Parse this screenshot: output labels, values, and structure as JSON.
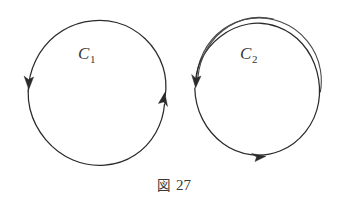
{
  "figure": {
    "caption_kanji": "図",
    "caption_number": "27",
    "background_color": "#ffffff",
    "stroke_color": "#2b2b2b",
    "text_color": "#3a3734"
  },
  "curves": [
    {
      "id": "c1",
      "label_letter": "C",
      "label_subscript": "1",
      "label_text": "C₁",
      "winding": "single",
      "turns": 1,
      "orientation": "clockwise",
      "center_x": 97,
      "center_y": 91,
      "radius": 69,
      "arrows": [
        {
          "name": "left-arrow",
          "direction": "down",
          "x": 29,
          "y": 82
        },
        {
          "name": "right-arrow",
          "direction": "up",
          "x": 161,
          "y": 97
        }
      ]
    },
    {
      "id": "c2",
      "label_letter": "C",
      "label_subscript": "2",
      "label_text": "C₂",
      "winding": "double",
      "turns": 2,
      "orientation": "clockwise",
      "center_x": 257,
      "center_y": 88,
      "radius": 63,
      "arrows": [
        {
          "name": "left-arrow",
          "direction": "down",
          "x": 196,
          "y": 82
        },
        {
          "name": "bottom-arrow",
          "direction": "right",
          "x": 258,
          "y": 157
        }
      ]
    }
  ]
}
